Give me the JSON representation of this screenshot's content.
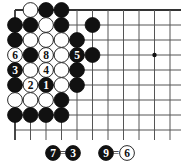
{
  "board": {
    "origin_x": 15,
    "origin_y": 10,
    "spacing_x": 15.5,
    "spacing_y": 15,
    "columns": 11,
    "rows": 9,
    "grid_right": 181,
    "grid_bottom": 140,
    "edges": [
      "top",
      "left"
    ],
    "star_points": [
      [
        9,
        3
      ]
    ],
    "colors": {
      "line": "#555555",
      "edge": "#333333",
      "black": "#111111",
      "white": "#ffffff"
    }
  },
  "stones": [
    {
      "col": 1,
      "row": 0,
      "color": "white"
    },
    {
      "col": 2,
      "row": 0,
      "color": "black"
    },
    {
      "col": 3,
      "row": 0,
      "color": "black"
    },
    {
      "col": 0,
      "row": 1,
      "color": "black"
    },
    {
      "col": 1,
      "row": 1,
      "color": "black"
    },
    {
      "col": 2,
      "row": 1,
      "color": "white"
    },
    {
      "col": 3,
      "row": 1,
      "color": "black"
    },
    {
      "col": 5,
      "row": 1,
      "color": "black"
    },
    {
      "col": 0,
      "row": 2,
      "color": "black"
    },
    {
      "col": 1,
      "row": 2,
      "color": "white"
    },
    {
      "col": 2,
      "row": 2,
      "color": "white"
    },
    {
      "col": 3,
      "row": 2,
      "color": "white"
    },
    {
      "col": 4,
      "row": 2,
      "color": "black"
    },
    {
      "col": 0,
      "row": 3,
      "color": "white",
      "label": "6"
    },
    {
      "col": 1,
      "row": 3,
      "color": "black"
    },
    {
      "col": 2,
      "row": 3,
      "color": "white",
      "label": "8"
    },
    {
      "col": 3,
      "row": 3,
      "color": "white"
    },
    {
      "col": 4,
      "row": 3,
      "color": "black",
      "label": "5"
    },
    {
      "col": 5,
      "row": 3,
      "color": "black"
    },
    {
      "col": 0,
      "row": 4,
      "color": "black",
      "label": "3"
    },
    {
      "col": 1,
      "row": 4,
      "color": "white"
    },
    {
      "col": 2,
      "row": 4,
      "color": "white",
      "label": "4"
    },
    {
      "col": 3,
      "row": 4,
      "color": "white"
    },
    {
      "col": 4,
      "row": 4,
      "color": "black"
    },
    {
      "col": 0,
      "row": 5,
      "color": "black"
    },
    {
      "col": 1,
      "row": 5,
      "color": "white",
      "label": "2"
    },
    {
      "col": 2,
      "row": 5,
      "color": "black",
      "label": "1"
    },
    {
      "col": 3,
      "row": 5,
      "color": "white"
    },
    {
      "col": 4,
      "row": 5,
      "color": "black"
    },
    {
      "col": 0,
      "row": 6,
      "color": "white"
    },
    {
      "col": 1,
      "row": 6,
      "color": "white"
    },
    {
      "col": 2,
      "row": 6,
      "color": "white"
    },
    {
      "col": 3,
      "row": 6,
      "color": "black"
    },
    {
      "col": 0,
      "row": 7,
      "color": "black"
    },
    {
      "col": 1,
      "row": 7,
      "color": "black"
    },
    {
      "col": 2,
      "row": 7,
      "color": "black"
    },
    {
      "col": 3,
      "row": 7,
      "color": "black"
    }
  ],
  "caption": {
    "items": [
      {
        "x": 53,
        "color": "black",
        "label": "7"
      },
      {
        "x": 63,
        "text": "="
      },
      {
        "x": 73,
        "color": "black",
        "label": "3"
      },
      {
        "x": 106,
        "color": "black",
        "label": "9"
      },
      {
        "x": 116,
        "text": "="
      },
      {
        "x": 127,
        "color": "white",
        "label": "6"
      }
    ],
    "y": 153
  }
}
